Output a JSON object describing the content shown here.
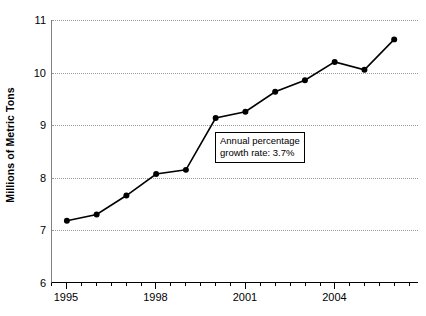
{
  "chart_data": {
    "type": "line",
    "title": "",
    "subtitle": "",
    "xlabel": "",
    "ylabel": "Millions of Metric Tons",
    "x": [
      1995,
      1996,
      1997,
      1998,
      1999,
      2000,
      2001,
      2002,
      2003,
      2004,
      2005,
      2006
    ],
    "values": [
      7.17,
      7.29,
      7.65,
      8.06,
      8.14,
      9.13,
      9.25,
      9.63,
      9.85,
      10.2,
      10.05,
      10.63
    ],
    "series": [
      {
        "name": "Millions of Metric Tons",
        "values": [
          7.17,
          7.29,
          7.65,
          8.06,
          8.14,
          9.13,
          9.25,
          9.63,
          9.85,
          10.2,
          10.05,
          10.63
        ]
      }
    ],
    "xlim": [
      1994.5,
      2006.8
    ],
    "ylim": [
      6,
      11
    ],
    "y_ticks": [
      6,
      7,
      8,
      9,
      10,
      11
    ],
    "y_tick_labels": [
      "6",
      "7",
      "8",
      "9",
      "10",
      "11"
    ],
    "x_major_ticks": [
      1995,
      1998,
      2001,
      2004
    ],
    "x_major_tick_labels": [
      "1995",
      "1998",
      "2001",
      "2004"
    ],
    "x_minor_ticks": [
      1996,
      1997,
      1999,
      2000,
      2002,
      2003,
      2005,
      2006
    ],
    "grid": "horizontal-dotted",
    "legend": "none",
    "marker": "filled-circle",
    "line_color": "#000000",
    "marker_color": "#000000",
    "grid_color": "#9a9a9a",
    "annotations": [
      {
        "name": "growth-rate-callout",
        "line1": "Annual percentage",
        "line2": "growth rate: 3.7%"
      }
    ]
  }
}
